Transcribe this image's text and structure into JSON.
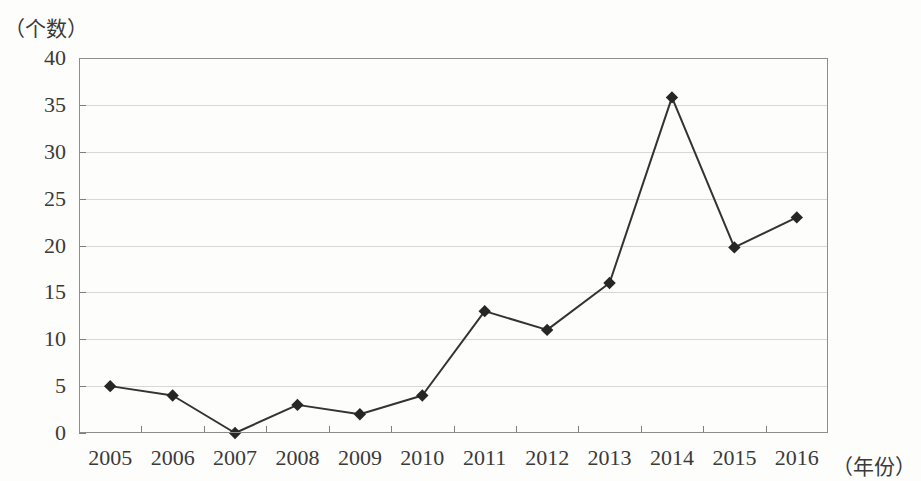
{
  "chart_data": {
    "type": "line",
    "title": "",
    "subtitle": "",
    "xlabel": "（年份）",
    "ylabel": "（个数）",
    "categories": [
      "2005",
      "2006",
      "2007",
      "2008",
      "2009",
      "2010",
      "2011",
      "2012",
      "2013",
      "2014",
      "2015",
      "2016"
    ],
    "values": [
      5,
      4,
      0,
      3,
      2,
      4,
      13,
      11,
      16,
      35.8,
      19.8,
      23
    ],
    "series": [
      {
        "name": "个数",
        "values": [
          5,
          4,
          0,
          3,
          2,
          4,
          13,
          11,
          16,
          35.8,
          19.8,
          23
        ]
      }
    ],
    "ylim": [
      0,
      40
    ],
    "y_ticks": [
      0,
      5,
      10,
      15,
      20,
      25,
      30,
      35,
      40
    ],
    "y_tick_labels": [
      "0",
      "5",
      "10",
      "15",
      "20",
      "25",
      "30",
      "35",
      "40"
    ],
    "grid": true,
    "grid_axis": "y",
    "legend": false,
    "legend_position": "none",
    "marker": "diamond",
    "line_color": "#333333",
    "marker_color": "#262626",
    "grid_color": "#d8d8d8",
    "frame_color": "#8d8d8d",
    "background_color": "#fdfdfb"
  }
}
